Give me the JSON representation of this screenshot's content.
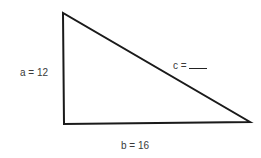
{
  "diagram": {
    "type": "right-triangle",
    "labels": {
      "a": "a = 12",
      "b": "b = 16",
      "c": "c ="
    },
    "stroke_color": "#1a1a1a",
    "vertices": {
      "top": [
        63,
        13
      ],
      "right_angle": [
        64,
        124
      ],
      "right": [
        250,
        122
      ]
    }
  }
}
